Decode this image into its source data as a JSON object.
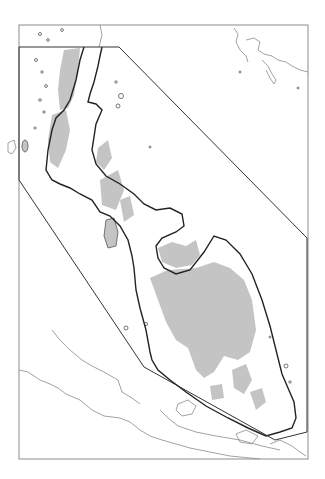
{
  "map": {
    "type": "regional outline map",
    "frame": {
      "x": 19,
      "y": 25,
      "width": 289,
      "height": 434,
      "stroke": "#8c8c8c"
    },
    "study_area_polygon": {
      "points": [
        [
          19,
          47
        ],
        [
          119,
          47
        ],
        [
          307,
          238
        ],
        [
          307,
          432
        ],
        [
          275,
          440
        ],
        [
          144,
          367
        ],
        [
          19,
          180
        ]
      ],
      "stroke": "#333333"
    },
    "colors": {
      "land_shade": "#c4c4c4",
      "coastline_main": "#222222",
      "coastline_thin": "#8a8a8a",
      "background": "#ffffff"
    },
    "labels": []
  }
}
